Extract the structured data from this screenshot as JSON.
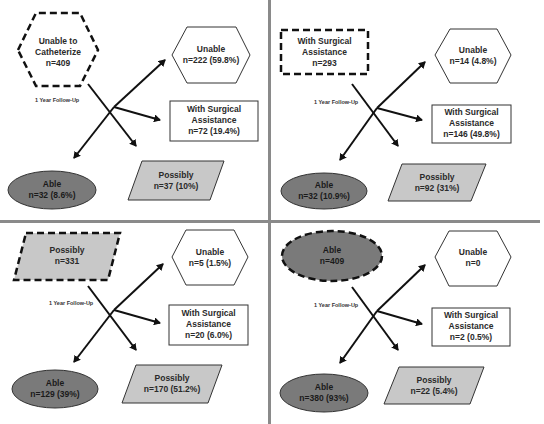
{
  "figure": {
    "follow_up_label": "1 Year Follow-Up",
    "colors": {
      "able_fill": "#7a7a7a",
      "possibly_fill": "#c8c8c8",
      "unable_fill": "#ffffff",
      "surgical_fill": "#ffffff",
      "divider": "#8a8a8a",
      "stroke": "#111111"
    },
    "panels": [
      {
        "source": {
          "shape": "hexagon",
          "line1": "Unable to",
          "line2": "Catheterize",
          "count": "n=409"
        },
        "outcomes": {
          "unable": {
            "label": "Unable",
            "value": "n=222  (59.8%)"
          },
          "surgical": {
            "label1": "With Surgical",
            "label2": "Assistance",
            "value": "n=72 (19.4%)"
          },
          "able": {
            "label": "Able",
            "value": "n=32 (8.6%)"
          },
          "possibly": {
            "label": "Possibly",
            "value": "n=37 (10%)"
          }
        }
      },
      {
        "source": {
          "shape": "rectangle",
          "line1": "With Surgical",
          "line2": "Assistance",
          "count": "n=293"
        },
        "outcomes": {
          "unable": {
            "label": "Unable",
            "value": "n=14  (4.8%)"
          },
          "surgical": {
            "label1": "With Surgical",
            "label2": "Assistance",
            "value": "n=146 (49.8%)"
          },
          "able": {
            "label": "Able",
            "value": "n=32 (10.9%)"
          },
          "possibly": {
            "label": "Possibly",
            "value": "n=92 (31%)"
          }
        }
      },
      {
        "source": {
          "shape": "parallelogram",
          "line1": "Possibly",
          "line2": "",
          "count": "n=331"
        },
        "outcomes": {
          "unable": {
            "label": "Unable",
            "value": "n=5  (1.5%)"
          },
          "surgical": {
            "label1": "With Surgical",
            "label2": "Assistance",
            "value": "n=20 (6.0%)"
          },
          "able": {
            "label": "Able",
            "value": "n=129 (39%)"
          },
          "possibly": {
            "label": "Possibly",
            "value": "n=170 (51.2%)"
          }
        }
      },
      {
        "source": {
          "shape": "ellipse",
          "line1": "Able",
          "line2": "",
          "count": "n=409"
        },
        "outcomes": {
          "unable": {
            "label": "Unable",
            "value": "n=0"
          },
          "surgical": {
            "label1": "With Surgical",
            "label2": "Assistance",
            "value": "n=2 (0.5%)"
          },
          "able": {
            "label": "Able",
            "value": "n=380 (93%)"
          },
          "possibly": {
            "label": "Possibly",
            "value": "n=22 (5.4%)"
          }
        }
      }
    ]
  }
}
